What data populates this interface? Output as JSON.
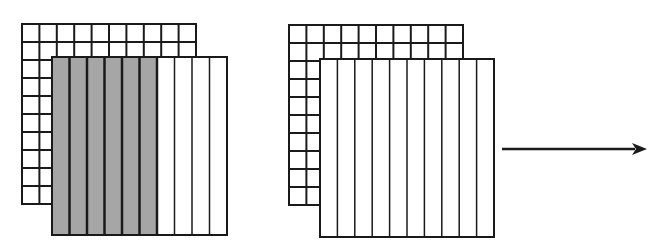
{
  "diagram": {
    "colors": {
      "stroke": "#1a1a1a",
      "shaded": "#a6a6a6",
      "background": "#ffffff"
    },
    "groups": [
      {
        "id": "left",
        "back_grid": {
          "x": 22,
          "y": 24,
          "w": 174,
          "h": 180,
          "rows": 10,
          "cols": 10
        },
        "front_strips": {
          "x": 52,
          "y": 57,
          "w": 175,
          "h": 178,
          "cols": 10,
          "shaded_cols": 6
        }
      },
      {
        "id": "right",
        "back_grid": {
          "x": 289,
          "y": 25,
          "w": 174,
          "h": 180,
          "rows": 10,
          "cols": 10
        },
        "front_strips": {
          "x": 320,
          "y": 59,
          "w": 174,
          "h": 178,
          "cols": 10,
          "shaded_cols": 0
        }
      }
    ],
    "arrow": {
      "x1": 502,
      "y1": 149,
      "x2": 647,
      "y2": 149,
      "direction": "right-arrow"
    }
  }
}
